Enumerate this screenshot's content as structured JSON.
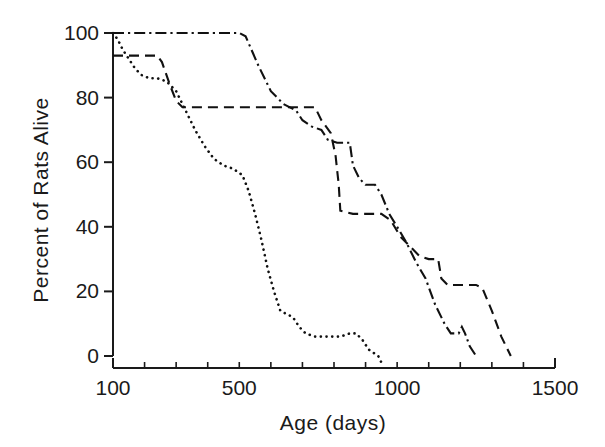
{
  "chart_data": {
    "type": "line",
    "title": "",
    "xlabel": "Age (days)",
    "ylabel": "Percent of Rats Alive",
    "xlim": [
      100,
      1500
    ],
    "ylim": [
      0,
      100
    ],
    "grid": false,
    "legend": "none",
    "x_ticks_major": [
      100,
      500,
      1000,
      1500
    ],
    "x_tick_labels": [
      "100",
      "500",
      "1000",
      "1500"
    ],
    "x_ticks_minor": [
      200,
      300,
      400,
      600,
      700,
      800,
      900,
      1100,
      1200,
      1300,
      1400
    ],
    "y_ticks": [
      0,
      20,
      40,
      60,
      80,
      100
    ],
    "y_tick_labels": [
      "0",
      "20",
      "40",
      "60",
      "80",
      "100"
    ],
    "series": [
      {
        "name": "dash-dot-curve",
        "style": "dash-dot",
        "points": [
          [
            100,
            100
          ],
          [
            500,
            100
          ],
          [
            520,
            99
          ],
          [
            560,
            90
          ],
          [
            600,
            82
          ],
          [
            640,
            78
          ],
          [
            680,
            76
          ],
          [
            700,
            73
          ],
          [
            730,
            71
          ],
          [
            760,
            70
          ],
          [
            780,
            67
          ],
          [
            810,
            66
          ],
          [
            850,
            66
          ],
          [
            860,
            59
          ],
          [
            880,
            55
          ],
          [
            900,
            53
          ],
          [
            930,
            53
          ],
          [
            950,
            50
          ],
          [
            975,
            44
          ],
          [
            1000,
            40
          ],
          [
            1030,
            35
          ],
          [
            1060,
            29
          ],
          [
            1090,
            24
          ],
          [
            1120,
            16
          ],
          [
            1150,
            10
          ],
          [
            1170,
            7
          ],
          [
            1195,
            7
          ],
          [
            1205,
            9
          ],
          [
            1215,
            7
          ],
          [
            1230,
            3
          ],
          [
            1250,
            0
          ]
        ]
      },
      {
        "name": "dashed-curve",
        "style": "dashed",
        "points": [
          [
            100,
            93
          ],
          [
            240,
            93
          ],
          [
            255,
            91
          ],
          [
            280,
            84
          ],
          [
            300,
            79
          ],
          [
            320,
            77
          ],
          [
            700,
            77
          ],
          [
            740,
            77
          ],
          [
            760,
            73
          ],
          [
            790,
            69
          ],
          [
            805,
            62
          ],
          [
            815,
            53
          ],
          [
            820,
            45
          ],
          [
            860,
            44
          ],
          [
            950,
            44
          ],
          [
            980,
            42
          ],
          [
            1010,
            37
          ],
          [
            1040,
            34
          ],
          [
            1070,
            31
          ],
          [
            1100,
            30
          ],
          [
            1130,
            30
          ],
          [
            1140,
            24
          ],
          [
            1160,
            22
          ],
          [
            1250,
            22
          ],
          [
            1270,
            21
          ],
          [
            1300,
            14
          ],
          [
            1330,
            6
          ],
          [
            1360,
            0
          ]
        ]
      },
      {
        "name": "dotted-curve",
        "style": "dotted",
        "points": [
          [
            100,
            100
          ],
          [
            115,
            98
          ],
          [
            130,
            95
          ],
          [
            150,
            92
          ],
          [
            170,
            89
          ],
          [
            190,
            87
          ],
          [
            215,
            86
          ],
          [
            240,
            86
          ],
          [
            270,
            85
          ],
          [
            300,
            82
          ],
          [
            330,
            76
          ],
          [
            360,
            70
          ],
          [
            390,
            65
          ],
          [
            420,
            61
          ],
          [
            450,
            59
          ],
          [
            480,
            58
          ],
          [
            510,
            56
          ],
          [
            530,
            51
          ],
          [
            550,
            44
          ],
          [
            570,
            36
          ],
          [
            590,
            27
          ],
          [
            610,
            20
          ],
          [
            630,
            14
          ],
          [
            650,
            13
          ],
          [
            670,
            12
          ],
          [
            690,
            9
          ],
          [
            710,
            7
          ],
          [
            740,
            6
          ],
          [
            780,
            6
          ],
          [
            820,
            6
          ],
          [
            850,
            7
          ],
          [
            870,
            7
          ],
          [
            890,
            5
          ],
          [
            910,
            2
          ],
          [
            940,
            0
          ],
          [
            960,
            -4
          ]
        ]
      }
    ]
  },
  "axes": {
    "x_axis_name": "x-axis",
    "y_axis_name": "y-axis"
  }
}
